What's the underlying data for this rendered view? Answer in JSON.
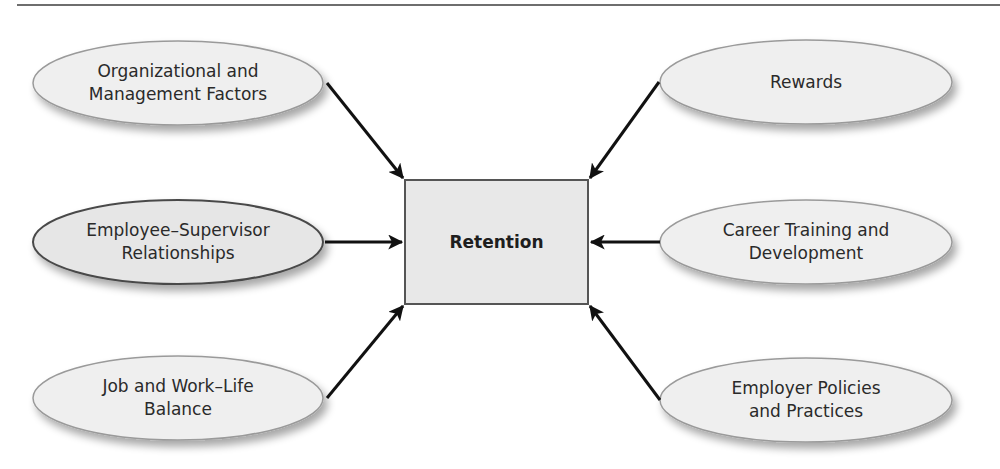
{
  "diagram": {
    "center": {
      "label": "Retention",
      "fill": "#e8e8e8",
      "stroke": "#555555"
    },
    "factors": [
      {
        "id": "org",
        "label": "Organizational and\nManagement Factors",
        "side": "left",
        "row": 0
      },
      {
        "id": "emp",
        "label": "Employee–Supervisor\nRelationships",
        "side": "left",
        "row": 1
      },
      {
        "id": "job",
        "label": "Job and Work–Life\nBalance",
        "side": "left",
        "row": 2
      },
      {
        "id": "rew",
        "label": "Rewards",
        "side": "right",
        "row": 0
      },
      {
        "id": "car",
        "label": "Career Training and\nDevelopment",
        "side": "right",
        "row": 1
      },
      {
        "id": "pol",
        "label": "Employer Policies\nand Practices",
        "side": "right",
        "row": 2
      }
    ],
    "colors": {
      "ellipse_fill": "#efefef",
      "ellipse_stroke": "#9a9a9a",
      "highlight_stroke": "#4a4a4a",
      "arrow": "#111111",
      "rule": "#6e6e6e"
    }
  }
}
